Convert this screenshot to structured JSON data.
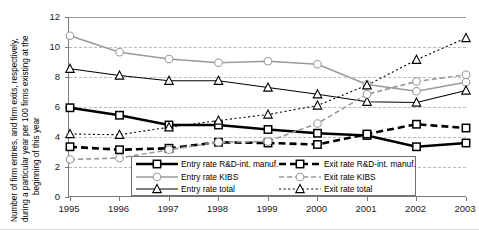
{
  "chart_data": {
    "type": "line",
    "title": "",
    "xlabel": "",
    "ylabel": "Number of firm entries, and firm exits, respectively, during a particular year per 100 firms existing at the beginning of this year",
    "ylabel_lines": [
      "Number of firm entries, and firm exits, respectively,",
      "during a particular year per 100 firms existing at the",
      "beginning of this year"
    ],
    "categories": [
      "1995",
      "1996",
      "1997",
      "1998",
      "1999",
      "2000",
      "2001",
      "2002",
      "2003"
    ],
    "x": [
      1995,
      1996,
      1997,
      1998,
      1999,
      2000,
      2001,
      2002,
      2003
    ],
    "ylim": [
      0,
      12
    ],
    "yticks": [
      "0",
      "2",
      "4",
      "6",
      "8",
      "10",
      "12"
    ],
    "ytick_values": [
      0,
      2,
      4,
      6,
      8,
      10,
      12
    ],
    "grid": true,
    "grid_axis": "y",
    "legend_position": "inside-bottom-center",
    "series": [
      {
        "name": "Entry rate R&D-int. manuf.",
        "key": "entry_rd",
        "values": [
          5.95,
          5.45,
          4.8,
          4.8,
          4.5,
          4.25,
          4.1,
          3.35,
          3.6
        ],
        "color": "#000000",
        "line": "solid",
        "width": 2.6,
        "marker": "square",
        "marker_fill": "#ffffff"
      },
      {
        "name": "Entry rate KIBS",
        "key": "entry_kibs",
        "values": [
          10.75,
          9.65,
          9.2,
          8.95,
          9.05,
          8.85,
          7.5,
          7.05,
          7.65
        ],
        "color": "#9a9a9a",
        "line": "solid",
        "width": 1.6,
        "marker": "circle",
        "marker_fill": "#ffffff"
      },
      {
        "name": "Entry rate total",
        "key": "entry_total",
        "values": [
          8.55,
          8.1,
          7.75,
          7.75,
          7.3,
          6.85,
          6.35,
          6.3,
          7.1
        ],
        "color": "#000000",
        "line": "solid",
        "width": 1.1,
        "marker": "triangle",
        "marker_fill": "#ffffff"
      },
      {
        "name": "Exit rate R&D-int. manuf.",
        "key": "exit_rd",
        "values": [
          3.35,
          3.15,
          3.25,
          3.65,
          3.6,
          3.5,
          4.2,
          4.85,
          4.6
        ],
        "color": "#000000",
        "line": "dashed",
        "width": 2.6,
        "marker": "square",
        "marker_fill": "#ffffff"
      },
      {
        "name": "Exit rate KIBS",
        "key": "exit_kibs",
        "values": [
          2.5,
          2.6,
          3.15,
          3.65,
          3.7,
          4.9,
          6.85,
          7.7,
          8.15
        ],
        "color": "#9a9a9a",
        "line": "dashed",
        "width": 1.6,
        "marker": "circle",
        "marker_fill": "#ffffff"
      },
      {
        "name": "Exit rate total",
        "key": "exit_total",
        "values": [
          4.2,
          4.15,
          4.65,
          5.1,
          5.5,
          6.1,
          7.45,
          9.15,
          10.6
        ],
        "color": "#000000",
        "line": "dotted",
        "width": 1.1,
        "marker": "triangle",
        "marker_fill": "#ffffff"
      }
    ],
    "legend": {
      "left_column": [
        "Entry rate R&D-int. manuf.",
        "Entry rate KIBS",
        "Entry rate total"
      ],
      "right_column": [
        "Exit rate R&D-int. manuf.",
        "Exit rate KIBS",
        "Exit rate total"
      ]
    }
  }
}
